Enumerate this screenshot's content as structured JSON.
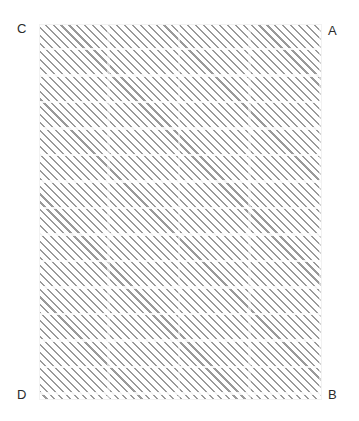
{
  "figure": {
    "type": "hatched-rectangle-diagram",
    "region": {
      "name": "hatched-region",
      "fill": "diagonal-hatch",
      "hatch_angle_deg": 45,
      "hatch_color": "#9a9a9a",
      "background_color": "#ffffff",
      "x": 39,
      "y": 24,
      "width": 283,
      "height": 376
    },
    "vertices": [
      {
        "id": "A",
        "label": "A",
        "position": "top-right"
      },
      {
        "id": "B",
        "label": "B",
        "position": "bottom-right"
      },
      {
        "id": "C",
        "label": "C",
        "position": "top-left"
      },
      {
        "id": "D",
        "label": "D",
        "position": "bottom-left"
      }
    ]
  },
  "canvas": {
    "background_color": "#ffffff",
    "width": 359,
    "height": 421
  }
}
